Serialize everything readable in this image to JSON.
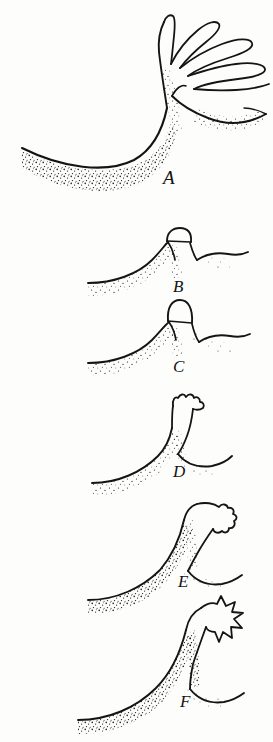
{
  "figure": {
    "medium": "pen-and-ink line drawing with stipple shading",
    "background_color": "#fdfdfc",
    "ink_color": "#141414",
    "width": 273,
    "height": 742
  },
  "panels": [
    {
      "id": "panel-a",
      "label": "A",
      "label_x": 163,
      "label_y": 168,
      "label_size": 19,
      "description": "Fully developed crown; surface sheet has broken into five long finger-like jets spreading up and to the right above a deep trough.",
      "stage_index": 1,
      "jet_count": 5
    },
    {
      "id": "panel-b",
      "label": "B",
      "label_x": 173,
      "label_y": 278,
      "label_size": 17,
      "description": "Low rounded mound with a small flattened dome cap resting on its summit.",
      "stage_index": 2,
      "jet_count": 0
    },
    {
      "id": "panel-c",
      "label": "C",
      "label_x": 173,
      "label_y": 358,
      "label_size": 17,
      "description": "Mound with a taller, narrower elongated cap beginning to lift from the summit.",
      "stage_index": 3,
      "jet_count": 0
    },
    {
      "id": "panel-d",
      "label": "D",
      "label_x": 173,
      "label_y": 463,
      "label_size": 17,
      "description": "Column rising from the surface with a lobed, jagged crown head just starting to split.",
      "stage_index": 4,
      "jet_count": 3
    },
    {
      "id": "panel-e",
      "label": "E",
      "label_x": 178,
      "label_y": 573,
      "label_size": 17,
      "description": "Taller column curving to the right, with a ragged crown head and a deeper trough beneath.",
      "stage_index": 5,
      "jet_count": 4
    },
    {
      "id": "panel-f",
      "label": "F",
      "label_x": 180,
      "label_y": 693,
      "label_size": 17,
      "description": "Tallest curving column with a pronounced spiked crown of five sharp jets and a deep cavity below.",
      "stage_index": 6,
      "jet_count": 5
    }
  ]
}
